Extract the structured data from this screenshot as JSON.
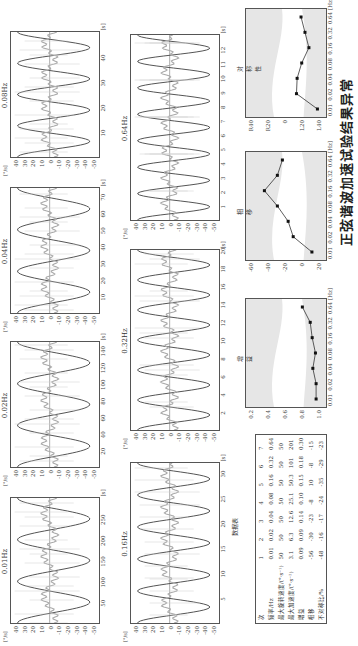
{
  "caption": "正弦谐波加速试验结果异常",
  "units": {
    "y_left": "[°/s]",
    "y_right": "[°/s]",
    "y_pct": "[%]",
    "x_s": "[s]",
    "x_hz": "[Hz]",
    "y_deg": "[°]"
  },
  "yticks": [
    "40",
    "30",
    "20",
    "10",
    "0",
    "-10",
    "-20",
    "-30",
    "-40",
    "-50"
  ],
  "waveforms": [
    {
      "title": "0.01Hz",
      "xticks": [
        "50",
        "100",
        "150",
        "200",
        "250"
      ],
      "xmax": 300,
      "cycles": 3
    },
    {
      "title": "0.02Hz",
      "xticks": [
        "20",
        "40",
        "60",
        "80",
        "100",
        "120",
        "140"
      ],
      "xmax": 150,
      "cycles": 3
    },
    {
      "title": "0.04Hz",
      "xticks": [
        "10",
        "20",
        "30",
        "40",
        "50",
        "60",
        "70"
      ],
      "xmax": 75,
      "cycles": 3
    },
    {
      "title": "0.08Hz",
      "xticks": [
        "10",
        "20",
        "30",
        "40"
      ],
      "xmax": 50,
      "cycles": 4
    },
    {
      "title": "0.16Hz",
      "xticks": [
        "5",
        "10",
        "15",
        "20",
        "25",
        "30"
      ],
      "xmax": 32,
      "cycles": 5
    },
    {
      "title": "0.32Hz",
      "xticks": [
        "2",
        "4",
        "6",
        "8",
        "10",
        "12",
        "14",
        "16",
        "18",
        "20"
      ],
      "xmax": 20,
      "cycles": 6
    },
    {
      "title": "0.64Hz",
      "xticks": [
        "1",
        "2",
        "3",
        "4",
        "5",
        "6",
        "7",
        "8",
        "9",
        "10",
        "11",
        "12"
      ],
      "xmax": 13,
      "cycles": 7
    }
  ],
  "table": {
    "title": "数据表",
    "header": [
      "次",
      "1",
      "2",
      "3",
      "4",
      "5",
      "6",
      "7"
    ],
    "rows": [
      [
        "频率/Hz",
        "0.01",
        "0.02",
        "0.04",
        "0.08",
        "0.16",
        "0.32",
        "0.64"
      ],
      [
        "最大旋转速度/(°·s⁻¹)",
        "50",
        "50",
        "50",
        "50",
        "50",
        "50",
        "50"
      ],
      [
        "最大加速度/(°·s⁻²)",
        "3.1",
        "6.3",
        "12.6",
        "25.1",
        "50.3",
        "101",
        "201"
      ],
      [
        "增益",
        "0.09",
        "0.09",
        "0.14",
        "0.10",
        "0.15",
        "0.18",
        "0.30"
      ],
      [
        "相移",
        "-56",
        "-30",
        "-23",
        "-8",
        "10",
        "-8",
        "-15"
      ],
      [
        "不对称比/%",
        "-48",
        "-16",
        "-17",
        "-24",
        "-35",
        "-29",
        "-23"
      ]
    ]
  },
  "chart_data": [
    {
      "type": "line",
      "title": "增益",
      "x": [
        "0.01",
        "0.02",
        "0.04",
        "0.08",
        "0.16",
        "0.32",
        "0.64"
      ],
      "values": [
        0.09,
        0.09,
        0.14,
        0.1,
        0.15,
        0.18,
        0.3
      ],
      "yticks": [
        "0.2",
        "0.4",
        "0.6",
        "0.8",
        "1.0"
      ],
      "ylim": [
        0,
        1.1
      ],
      "xlabel": "[Hz]"
    },
    {
      "type": "line",
      "title": "相移",
      "x": [
        "0.01",
        "0.02",
        "0.04",
        "0.08",
        "0.16",
        "0.32",
        "0.64"
      ],
      "values": [
        -56,
        -30,
        -23,
        -8,
        10,
        -8,
        -15
      ],
      "yticks": [
        "-60",
        "-40",
        "-20",
        "0",
        "20"
      ],
      "ylim": [
        -70,
        30
      ],
      "ylabel": "[°]",
      "xlabel": "[Hz]"
    },
    {
      "type": "line",
      "title": "对称性",
      "x": [
        "0.01",
        "0.02",
        "0.04",
        "0.08",
        "0.16",
        "0.32",
        "0.64"
      ],
      "values": [
        -48,
        -16,
        -17,
        -24,
        -35,
        -29,
        -23
      ],
      "yticks": [
        "R40",
        "R20",
        "0",
        "L20",
        "L40"
      ],
      "ylim": [
        -55,
        55
      ],
      "ylabel": "[%]",
      "xlabel": "[Hz]"
    }
  ]
}
